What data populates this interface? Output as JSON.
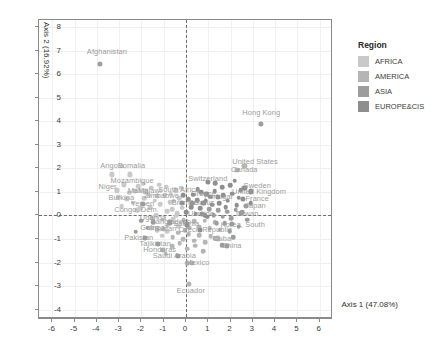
{
  "chart_data": {
    "type": "scatter",
    "title": "",
    "xlabel": "Axis 1 (47.08%)",
    "ylabel": "Axis 2 (16.92%)",
    "xlim": [
      -6.6,
      6.6
    ],
    "ylim": [
      -4.4,
      8.3
    ],
    "xticks": [
      -6,
      -5,
      -4,
      -3,
      -2,
      -1,
      0,
      1,
      2,
      3,
      4,
      5,
      6
    ],
    "yticks": [
      -4,
      -3,
      -2,
      -1,
      0,
      1,
      2,
      3,
      4,
      5,
      6,
      7,
      8
    ],
    "grid": true,
    "reference_lines": {
      "vertical_at_x": 0,
      "horizontal_at_y": 0,
      "style": "dashed"
    },
    "legend": {
      "title": "Region",
      "position": "right",
      "entries": [
        {
          "label": "AFRICA",
          "color": "#c9c9c9"
        },
        {
          "label": "AMERICA",
          "color": "#b5b5b5"
        },
        {
          "label": "ASIA",
          "color": "#9d9d9d"
        },
        {
          "label": "EUROPE&CIS",
          "color": "#8e8e8e"
        }
      ]
    },
    "labeled_points": [
      {
        "label": "Afghanistan",
        "x": -3.85,
        "y": 6.45,
        "region": "ASIA",
        "lx": -3.55,
        "ly": 6.95
      },
      {
        "label": "Hong Kong",
        "x": 3.38,
        "y": 3.88,
        "region": "ASIA",
        "lx": 3.38,
        "ly": 4.35
      },
      {
        "label": "United States",
        "x": 2.62,
        "y": 2.12,
        "region": "AMERICA",
        "lx": 3.1,
        "ly": 2.28
      },
      {
        "label": "Canada",
        "x": 2.3,
        "y": 1.92,
        "region": "AMERICA",
        "lx": 2.62,
        "ly": 1.92
      },
      {
        "label": "Angola",
        "x": -3.32,
        "y": 1.74,
        "region": "AFRICA",
        "lx": -3.32,
        "ly": 2.12
      },
      {
        "label": "Somalia",
        "x": -2.52,
        "y": 1.74,
        "region": "AFRICA",
        "lx": -2.45,
        "ly": 2.12
      },
      {
        "label": "Switzerland",
        "x": 1.0,
        "y": 1.42,
        "region": "EUROPE&CIS",
        "lx": 0.98,
        "ly": 1.56
      },
      {
        "label": "Sweden",
        "x": 2.62,
        "y": 1.16,
        "region": "EUROPE&CIS",
        "lx": 3.2,
        "ly": 1.24
      },
      {
        "label": "United Kingdom",
        "x": 2.9,
        "y": 1.02,
        "region": "EUROPE&CIS",
        "lx": 3.28,
        "ly": 1.0
      },
      {
        "label": "France",
        "x": 2.55,
        "y": 0.7,
        "region": "EUROPE&CIS",
        "lx": 3.2,
        "ly": 0.7
      },
      {
        "label": "Japan",
        "x": 2.7,
        "y": 0.42,
        "region": "ASIA",
        "lx": 3.12,
        "ly": 0.4
      },
      {
        "label": "Taiwan",
        "x": 2.45,
        "y": 0.1,
        "region": "ASIA",
        "lx": 2.72,
        "ly": 0.08
      },
      {
        "label": "Korea, South",
        "x": 2.05,
        "y": -0.35,
        "region": "ASIA",
        "lx": 2.55,
        "ly": -0.4
      },
      {
        "label": "Mozambique",
        "x": -2.8,
        "y": 1.32,
        "region": "AFRICA",
        "lx": -2.42,
        "ly": 1.48
      },
      {
        "label": "Niger",
        "x": -3.1,
        "y": 1.06,
        "region": "AFRICA",
        "lx": -3.52,
        "ly": 1.2
      },
      {
        "label": "Mali",
        "x": -2.3,
        "y": 1.04,
        "region": "AFRICA",
        "lx": -2.3,
        "ly": 1.02
      },
      {
        "label": "Malawi",
        "x": -1.82,
        "y": 1.02,
        "region": "AFRICA",
        "lx": -1.62,
        "ly": 1.04
      },
      {
        "label": "Zimbabwe",
        "x": -1.3,
        "y": 0.82,
        "region": "AFRICA",
        "lx": -1.1,
        "ly": 0.82
      },
      {
        "label": "Burkina",
        "x": -2.65,
        "y": 0.7,
        "region": "AFRICA",
        "lx": -2.9,
        "ly": 0.72
      },
      {
        "label": "South Africa",
        "x": -0.45,
        "y": 1.06,
        "region": "AFRICA",
        "lx": -0.32,
        "ly": 1.06
      },
      {
        "label": "Yemen",
        "x": -1.95,
        "y": 0.48,
        "region": "ASIA",
        "lx": -1.95,
        "ly": 0.48
      },
      {
        "label": "Bremen",
        "x": -0.2,
        "y": 0.52,
        "region": "EUROPE&CIS",
        "lx": -0.05,
        "ly": 0.52
      },
      {
        "label": "Congo, Dem.",
        "x": -2.18,
        "y": 0.22,
        "region": "AFRICA",
        "lx": -2.22,
        "ly": 0.22
      },
      {
        "label": "Greece",
        "x": 0.92,
        "y": 0.92,
        "region": "EUROPE&CIS",
        "lx": 0.78,
        "ly": 0.92
      },
      {
        "label": "Portugal",
        "x": 1.45,
        "y": 0.78,
        "region": "EUROPE&CIS",
        "lx": 1.45,
        "ly": 0.78
      },
      {
        "label": "Belarus",
        "x": 0.78,
        "y": 0.52,
        "region": "EUROPE&CIS",
        "lx": 0.7,
        "ly": 0.52
      },
      {
        "label": "Ukraine",
        "x": 0.72,
        "y": 0.06,
        "region": "EUROPE&CIS",
        "lx": 0.68,
        "ly": 0.06
      },
      {
        "label": "Uganda",
        "x": -1.52,
        "y": -0.12,
        "region": "AFRICA",
        "lx": -1.48,
        "ly": -0.12
      },
      {
        "label": "Guinea",
        "x": -1.55,
        "y": -0.52,
        "region": "AFRICA",
        "lx": -1.5,
        "ly": -0.52
      },
      {
        "label": "Sudan",
        "x": -1.0,
        "y": -0.56,
        "region": "AFRICA",
        "lx": -0.92,
        "ly": -0.56
      },
      {
        "label": "Pakistan",
        "x": -1.85,
        "y": -0.95,
        "region": "ASIA",
        "lx": -2.12,
        "ly": -0.98
      },
      {
        "label": "Tajikistan",
        "x": -1.25,
        "y": -1.2,
        "region": "ASIA",
        "lx": -1.38,
        "ly": -1.22
      },
      {
        "label": "Honduras",
        "x": -1.02,
        "y": -1.48,
        "region": "AMERICA",
        "lx": -1.18,
        "ly": -1.48
      },
      {
        "label": "Saudi Arabia",
        "x": -0.35,
        "y": -1.72,
        "region": "ASIA",
        "lx": -0.52,
        "ly": -1.74
      },
      {
        "label": "Cuba",
        "x": 1.42,
        "y": -0.98,
        "region": "AMERICA",
        "lx": 1.62,
        "ly": -1.0
      },
      {
        "label": "China",
        "x": 1.85,
        "y": -1.3,
        "region": "ASIA",
        "lx": 2.05,
        "ly": -1.32
      },
      {
        "label": "Mexico",
        "x": 0.28,
        "y": -2.02,
        "region": "AMERICA",
        "lx": 0.52,
        "ly": -2.04
      },
      {
        "label": "Ecuador",
        "x": 0.12,
        "y": -2.92,
        "region": "AMERICA",
        "lx": 0.22,
        "ly": -3.22
      },
      {
        "label": "Czech Republic",
        "x": 0.62,
        "y": -0.62,
        "region": "EUROPE&CIS",
        "lx": 0.86,
        "ly": -0.64
      },
      {
        "label": "Bangladesh",
        "x": -0.72,
        "y": -0.3,
        "region": "ASIA",
        "lx": -0.68,
        "ly": -0.3
      },
      {
        "label": "Estonia",
        "x": 0.05,
        "y": -0.38,
        "region": "EUROPE&CIS",
        "lx": 0.02,
        "ly": -0.38
      }
    ],
    "unlabeled_points": [
      {
        "x": -0.95,
        "y": 0.86,
        "r": "AFRICA"
      },
      {
        "x": -0.68,
        "y": 0.92,
        "r": "AFRICA"
      },
      {
        "x": -0.55,
        "y": 0.62,
        "r": "AFRICA"
      },
      {
        "x": -0.3,
        "y": 0.74,
        "r": "AFRICA"
      },
      {
        "x": -0.12,
        "y": 0.86,
        "r": "EUROPE&CIS"
      },
      {
        "x": 0.1,
        "y": 0.7,
        "r": "EUROPE&CIS"
      },
      {
        "x": 0.32,
        "y": 0.88,
        "r": "EUROPE&CIS"
      },
      {
        "x": 0.5,
        "y": 0.64,
        "r": "EUROPE&CIS"
      },
      {
        "x": 0.68,
        "y": 0.98,
        "r": "EUROPE&CIS"
      },
      {
        "x": 0.88,
        "y": 0.62,
        "r": "EUROPE&CIS"
      },
      {
        "x": 1.08,
        "y": 0.8,
        "r": "EUROPE&CIS"
      },
      {
        "x": 1.28,
        "y": 1.02,
        "r": "EUROPE&CIS"
      },
      {
        "x": 1.48,
        "y": 0.52,
        "r": "EUROPE&CIS"
      },
      {
        "x": 1.68,
        "y": 0.86,
        "r": "EUROPE&CIS"
      },
      {
        "x": 1.88,
        "y": 0.62,
        "r": "EUROPE&CIS"
      },
      {
        "x": 2.08,
        "y": 0.92,
        "r": "EUROPE&CIS"
      },
      {
        "x": 2.28,
        "y": 0.44,
        "r": "EUROPE&CIS"
      },
      {
        "x": 2.46,
        "y": 1.06,
        "r": "EUROPE&CIS"
      },
      {
        "x": 1.98,
        "y": 1.28,
        "r": "EUROPE&CIS"
      },
      {
        "x": 1.62,
        "y": 1.2,
        "r": "EUROPE&CIS"
      },
      {
        "x": 1.3,
        "y": 1.36,
        "r": "EUROPE&CIS"
      },
      {
        "x": 2.18,
        "y": 1.48,
        "r": "EUROPE&CIS"
      },
      {
        "x": -1.15,
        "y": 0.48,
        "r": "AFRICA"
      },
      {
        "x": -1.4,
        "y": 0.62,
        "r": "AFRICA"
      },
      {
        "x": -1.62,
        "y": 0.34,
        "r": "AFRICA"
      },
      {
        "x": -1.88,
        "y": 0.74,
        "r": "AFRICA"
      },
      {
        "x": -2.05,
        "y": 0.3,
        "r": "AFRICA"
      },
      {
        "x": -2.4,
        "y": 0.54,
        "r": "AFRICA"
      },
      {
        "x": -0.85,
        "y": 0.18,
        "r": "AFRICA"
      },
      {
        "x": -0.62,
        "y": 0.26,
        "r": "AFRICA"
      },
      {
        "x": -0.4,
        "y": 0.1,
        "r": "AFRICA"
      },
      {
        "x": -0.18,
        "y": 0.32,
        "r": "AFRICA"
      },
      {
        "x": 0.02,
        "y": 0.14,
        "r": "EUROPE&CIS"
      },
      {
        "x": 0.24,
        "y": 0.34,
        "r": "EUROPE&CIS"
      },
      {
        "x": 0.44,
        "y": 0.08,
        "r": "EUROPE&CIS"
      },
      {
        "x": 0.64,
        "y": 0.3,
        "r": "EUROPE&CIS"
      },
      {
        "x": 0.84,
        "y": 0.02,
        "r": "EUROPE&CIS"
      },
      {
        "x": 1.04,
        "y": 0.26,
        "r": "ASIA"
      },
      {
        "x": 1.24,
        "y": 0.0,
        "r": "ASIA"
      },
      {
        "x": 1.44,
        "y": 0.22,
        "r": "ASIA"
      },
      {
        "x": 1.64,
        "y": -0.06,
        "r": "ASIA"
      },
      {
        "x": 1.84,
        "y": 0.16,
        "r": "ASIA"
      },
      {
        "x": 2.04,
        "y": -0.12,
        "r": "ASIA"
      },
      {
        "x": 2.24,
        "y": 0.24,
        "r": "ASIA"
      },
      {
        "x": -1.05,
        "y": -0.18,
        "r": "AFRICA"
      },
      {
        "x": -0.82,
        "y": -0.42,
        "r": "AFRICA"
      },
      {
        "x": -0.58,
        "y": -0.14,
        "r": "AFRICA"
      },
      {
        "x": -0.34,
        "y": -0.46,
        "r": "AFRICA"
      },
      {
        "x": -0.1,
        "y": -0.2,
        "r": "AMERICA"
      },
      {
        "x": 0.14,
        "y": -0.52,
        "r": "AMERICA"
      },
      {
        "x": 0.38,
        "y": -0.24,
        "r": "AMERICA"
      },
      {
        "x": 0.6,
        "y": -0.48,
        "r": "AMERICA"
      },
      {
        "x": 0.84,
        "y": -0.22,
        "r": "AMERICA"
      },
      {
        "x": 1.06,
        "y": -0.54,
        "r": "AMERICA"
      },
      {
        "x": 1.28,
        "y": -0.28,
        "r": "AMERICA"
      },
      {
        "x": 1.52,
        "y": -0.6,
        "r": "AMERICA"
      },
      {
        "x": 1.74,
        "y": -0.34,
        "r": "ASIA"
      },
      {
        "x": 1.96,
        "y": -0.66,
        "r": "ASIA"
      },
      {
        "x": -1.3,
        "y": -0.62,
        "r": "AFRICA"
      },
      {
        "x": -1.08,
        "y": -0.86,
        "r": "AFRICA"
      },
      {
        "x": -0.84,
        "y": -0.7,
        "r": "AFRICA"
      },
      {
        "x": -0.6,
        "y": -0.92,
        "r": "AMERICA"
      },
      {
        "x": -0.36,
        "y": -0.74,
        "r": "AMERICA"
      },
      {
        "x": -0.12,
        "y": -1.02,
        "r": "AMERICA"
      },
      {
        "x": 0.12,
        "y": -0.8,
        "r": "AMERICA"
      },
      {
        "x": 0.36,
        "y": -1.08,
        "r": "AMERICA"
      },
      {
        "x": 0.6,
        "y": -0.84,
        "r": "AMERICA"
      },
      {
        "x": 0.86,
        "y": -1.14,
        "r": "AMERICA"
      },
      {
        "x": 1.1,
        "y": -0.88,
        "r": "AMERICA"
      },
      {
        "x": 1.62,
        "y": -1.26,
        "r": "ASIA"
      },
      {
        "x": -0.62,
        "y": -1.32,
        "r": "AMERICA"
      },
      {
        "x": -0.28,
        "y": -1.18,
        "r": "AMERICA"
      },
      {
        "x": 0.06,
        "y": -1.42,
        "r": "AMERICA"
      },
      {
        "x": 0.42,
        "y": -1.28,
        "r": "AMERICA"
      },
      {
        "x": 0.78,
        "y": -1.52,
        "r": "AMERICA"
      },
      {
        "x": -0.92,
        "y": -1.62,
        "r": "AMERICA"
      },
      {
        "x": -1.48,
        "y": -0.3,
        "r": "ASIA"
      },
      {
        "x": -1.72,
        "y": -0.52,
        "r": "ASIA"
      },
      {
        "x": -2.0,
        "y": -0.22,
        "r": "ASIA"
      },
      {
        "x": -2.25,
        "y": -0.7,
        "r": "ASIA"
      },
      {
        "x": -2.55,
        "y": 0.96,
        "r": "AFRICA"
      },
      {
        "x": -2.88,
        "y": 0.4,
        "r": "AFRICA"
      },
      {
        "x": -3.05,
        "y": 0.78,
        "r": "AFRICA"
      },
      {
        "x": -2.15,
        "y": 1.24,
        "r": "AFRICA"
      },
      {
        "x": -1.92,
        "y": 1.34,
        "r": "AFRICA"
      },
      {
        "x": -1.55,
        "y": 1.18,
        "r": "AFRICA"
      },
      {
        "x": -1.2,
        "y": 1.3,
        "r": "AFRICA"
      },
      {
        "x": -0.88,
        "y": 1.22,
        "r": "AFRICA"
      },
      {
        "x": 2.52,
        "y": 0.14,
        "r": "ASIA"
      },
      {
        "x": 2.74,
        "y": -0.18,
        "r": "ASIA"
      },
      {
        "x": 2.36,
        "y": -0.48,
        "r": "ASIA"
      },
      {
        "x": 2.9,
        "y": 0.52,
        "r": "EUROPE&CIS"
      },
      {
        "x": 2.12,
        "y": -0.92,
        "r": "ASIA"
      },
      {
        "x": -0.45,
        "y": -0.02,
        "r": "AFRICA"
      },
      {
        "x": -0.05,
        "y": -0.62,
        "r": "AMERICA"
      },
      {
        "x": 0.28,
        "y": 0.52,
        "r": "EUROPE&CIS"
      },
      {
        "x": 1.18,
        "y": 0.46,
        "r": "EUROPE&CIS"
      },
      {
        "x": 1.78,
        "y": 0.34,
        "r": "EUROPE&CIS"
      },
      {
        "x": -1.68,
        "y": 0.86,
        "r": "AFRICA"
      },
      {
        "x": -1.35,
        "y": 0.02,
        "r": "AFRICA"
      },
      {
        "x": 0.94,
        "y": -0.06,
        "r": "EUROPE&CIS"
      },
      {
        "x": 1.38,
        "y": -0.34,
        "r": "ASIA"
      },
      {
        "x": -0.72,
        "y": 0.56,
        "r": "AFRICA"
      },
      {
        "x": 0.52,
        "y": 1.12,
        "r": "EUROPE&CIS"
      },
      {
        "x": -0.22,
        "y": 1.18,
        "r": "AFRICA"
      },
      {
        "x": 2.36,
        "y": 0.76,
        "r": "EUROPE&CIS"
      },
      {
        "x": 0.06,
        "y": -2.02,
        "r": "AMERICA"
      },
      {
        "x": 1.28,
        "y": -0.96,
        "r": "AMERICA"
      }
    ]
  },
  "axes": {
    "x_title": "Axis 1 (47.08%)",
    "y_title": "Axis 2 (16.92%)"
  },
  "legend": {
    "title": "Region",
    "items": [
      {
        "label": "AFRICA",
        "color": "#c9c9c9"
      },
      {
        "label": "AMERICA",
        "color": "#b5b5b5"
      },
      {
        "label": "ASIA",
        "color": "#9d9d9d"
      },
      {
        "label": "EUROPE&CIS",
        "color": "#8e8e8e"
      }
    ]
  }
}
